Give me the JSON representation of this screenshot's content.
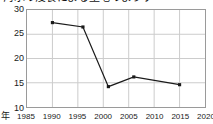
{
  "chart_data": {
    "type": "line",
    "title": "海水の浸食による土地のようす",
    "xlabel": "年",
    "ylabel": "",
    "xlim": [
      1985,
      2020
    ],
    "ylim": [
      10,
      30
    ],
    "grid": true,
    "legend": null,
    "xticks": [
      "1985",
      "1990",
      "1995",
      "2000",
      "2005",
      "2010",
      "2015",
      "2020"
    ],
    "yticks": [
      "10",
      "15",
      "20",
      "25",
      "30"
    ],
    "series": [
      {
        "name": "値",
        "color": "#1a1a1a",
        "marker": "square",
        "x": [
          1990,
          1996,
          2001,
          2006,
          2015
        ],
        "values": [
          27.4,
          26.5,
          14.2,
          16.2,
          14.6
        ]
      }
    ]
  },
  "axes": {
    "border_color": "#9a9a9a",
    "grid_color": "#cccccc",
    "background": "#ffffff"
  }
}
